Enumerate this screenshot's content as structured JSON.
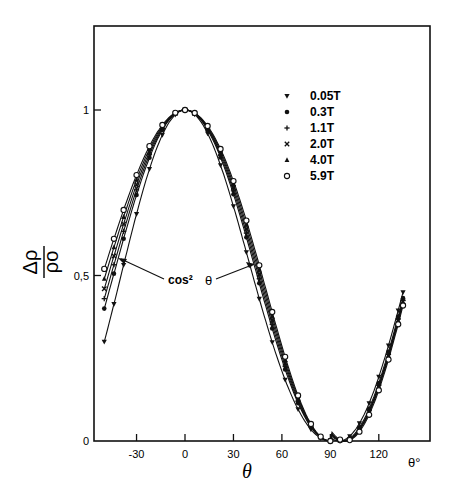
{
  "chart_data": {
    "type": "line",
    "title": "",
    "xlabel": "θ",
    "x_unit_label": "θ°",
    "ylabel": "Δρ/ρo",
    "xlim": [
      -56,
      151
    ],
    "ylim": [
      0,
      1.2
    ],
    "grid": false,
    "legend_position": "upper right inside",
    "x_ticks": [
      -30,
      0,
      30,
      60,
      90,
      120
    ],
    "x_tick_labels": [
      "-30",
      "0",
      "30",
      "60",
      "90",
      "120"
    ],
    "y_ticks": [
      0,
      0.5,
      1
    ],
    "y_tick_labels": [
      "0",
      "0,5",
      "1"
    ],
    "annotation": "cos² θ",
    "series": [
      {
        "name": "0.05T",
        "marker": "triangle-down",
        "x": [
          -50,
          -40,
          -20,
          0,
          20,
          40,
          60,
          75,
          90,
          105,
          120,
          135
        ],
        "values": [
          0.3,
          0.43,
          0.78,
          1.0,
          0.88,
          0.58,
          0.25,
          0.07,
          0.0,
          0.07,
          0.25,
          0.65
        ]
      },
      {
        "name": "0.3T",
        "marker": "filled-circle",
        "x": [
          -50,
          -40,
          -20,
          0,
          20,
          40,
          60,
          75,
          90,
          105,
          120,
          135
        ],
        "values": [
          0.4,
          0.52,
          0.84,
          1.0,
          0.92,
          0.64,
          0.3,
          0.09,
          0.0,
          0.1,
          0.32,
          0.7
        ]
      },
      {
        "name": "1.1T",
        "marker": "plus",
        "x": [
          -50,
          -40,
          -20,
          0,
          20,
          40,
          60,
          75,
          90,
          105,
          120,
          135
        ],
        "values": [
          0.43,
          0.55,
          0.86,
          1.0,
          0.93,
          0.66,
          0.31,
          0.1,
          0.0,
          0.11,
          0.34,
          0.72
        ]
      },
      {
        "name": "2.0T",
        "marker": "cross",
        "x": [
          -50,
          -40,
          -20,
          0,
          20,
          40,
          60,
          75,
          90,
          105,
          120,
          135
        ],
        "values": [
          0.46,
          0.58,
          0.87,
          1.0,
          0.94,
          0.68,
          0.33,
          0.1,
          0.0,
          0.12,
          0.35,
          0.73
        ]
      },
      {
        "name": "4.0T",
        "marker": "filled-triangle-up",
        "x": [
          -50,
          -40,
          -20,
          0,
          20,
          40,
          60,
          75,
          90,
          105,
          120,
          135
        ],
        "values": [
          0.49,
          0.61,
          0.88,
          1.0,
          0.95,
          0.7,
          0.34,
          0.11,
          0.0,
          0.12,
          0.36,
          0.74
        ]
      },
      {
        "name": "5.9T",
        "marker": "open-circle",
        "x": [
          -50,
          -40,
          -20,
          0,
          20,
          40,
          60,
          75,
          90,
          105,
          120,
          135
        ],
        "values": [
          0.52,
          0.64,
          0.9,
          1.0,
          0.96,
          0.72,
          0.36,
          0.12,
          0.0,
          0.13,
          0.37,
          0.76
        ]
      }
    ]
  },
  "labels": {
    "ylabel_num": "Δρ",
    "ylabel_den": "ρo",
    "xlabel": "θ",
    "x_unit": "θ°",
    "annotation_left": "cos²",
    "annotation_right": "θ"
  }
}
